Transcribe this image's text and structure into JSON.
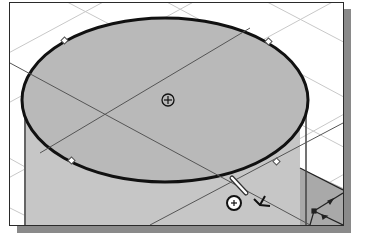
{
  "figure": {
    "caption": "Cylinder top face selected with center marker and datum axis triad"
  },
  "viewport": {
    "background": "#ffffff",
    "grid_color": "#c8c8c8",
    "face_fill": "#b9b9b9",
    "side_fill": "#c6c6c6",
    "edge_color": "#111111",
    "frame_border": "#2a2a2a",
    "shadow_color": "#8a8a8a"
  },
  "markers": {
    "center_point": "center-point-marker",
    "cursor": "pencil-cursor",
    "snap_glyph": "snap-center-icon",
    "constraint_glyph": "tangent-constraint-icon"
  }
}
